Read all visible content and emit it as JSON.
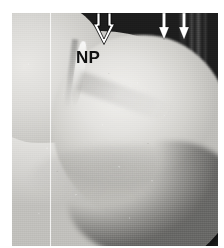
{
  "figure": {
    "domain": "Natural-Image",
    "kind": "grayscale-anatomical-specimen-photograph",
    "caption_visible": "",
    "background_color": "#ffffff",
    "plate": {
      "dark_field_color": "#1d1d1d",
      "specimen_color": "#e4e3e0",
      "border_color": "#ffffff"
    }
  },
  "annotations": {
    "labels": [
      {
        "id": "np",
        "text": "NP",
        "color": "#111111",
        "x": 64,
        "y": 36
      }
    ],
    "arrows": [
      {
        "id": "arrow-large-outlined",
        "style": "outlined-hollow",
        "direction": "down",
        "color": "#ffffff",
        "outline_color": "#000000",
        "x": 80,
        "y": 0,
        "width": 22,
        "height": 31
      },
      {
        "id": "arrow-thin-left",
        "style": "thin-solid",
        "direction": "down",
        "color": "#ffffff",
        "x": 145,
        "y": 0,
        "width": 12,
        "height": 26
      },
      {
        "id": "arrow-thin-right",
        "style": "thin-solid",
        "direction": "down",
        "color": "#ffffff",
        "x": 165,
        "y": 0,
        "width": 12,
        "height": 26
      }
    ],
    "fiducial_lines": [
      {
        "id": "vertical-scan-line",
        "orientation": "vertical",
        "color": "#ffffff",
        "x": 38
      }
    ]
  }
}
